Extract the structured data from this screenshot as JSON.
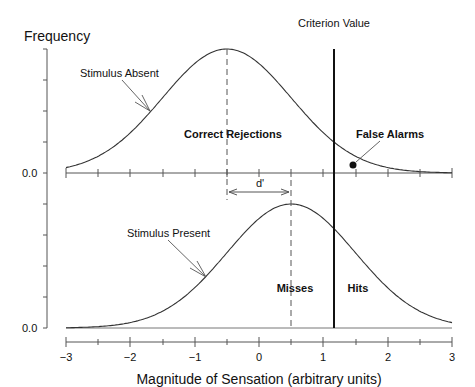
{
  "chart_data": {
    "type": "line",
    "title": "",
    "ylabel": "Frequency",
    "xlabel": "Magnitude of Sensation (arbitrary units)",
    "xlim": [
      -3,
      3
    ],
    "xticks": [
      -3,
      -2,
      -1,
      0,
      1,
      2,
      3
    ],
    "xtick_labels": [
      "−3",
      "−2",
      "−1",
      "0",
      "1",
      "2",
      "3"
    ],
    "y_baseline_labels": [
      "0.0",
      "0.0"
    ],
    "grid": false,
    "panels": [
      {
        "name": "Stimulus Absent",
        "distribution": "normal",
        "mean": -0.5,
        "sd": 1.0,
        "label": "Stimulus Absent",
        "regions": [
          "Correct Rejections",
          "False Alarms"
        ]
      },
      {
        "name": "Stimulus Present",
        "distribution": "normal",
        "mean": 0.5,
        "sd": 1.0,
        "label": "Stimulus Present",
        "regions": [
          "Misses",
          "Hits"
        ]
      }
    ],
    "criterion": {
      "label": "Criterion Value",
      "x": 1.15
    },
    "d_prime": {
      "label": "d'",
      "from": -0.5,
      "to": 0.5
    }
  },
  "labels": {
    "frequency": "Frequency",
    "criterion": "Criterion Value",
    "stimulus_absent": "Stimulus Absent",
    "stimulus_present": "Stimulus Present",
    "correct_rejections": "Correct Rejections",
    "false_alarms": "False Alarms",
    "misses": "Misses",
    "hits": "Hits",
    "d_prime": "d'",
    "y_zero_top": "0.0",
    "y_zero_bottom": "0.0",
    "xlabel": "Magnitude of Sensation (arbitrary units)",
    "ticks": [
      "−3",
      "−2",
      "−1",
      "0",
      "1",
      "2",
      "3"
    ]
  }
}
